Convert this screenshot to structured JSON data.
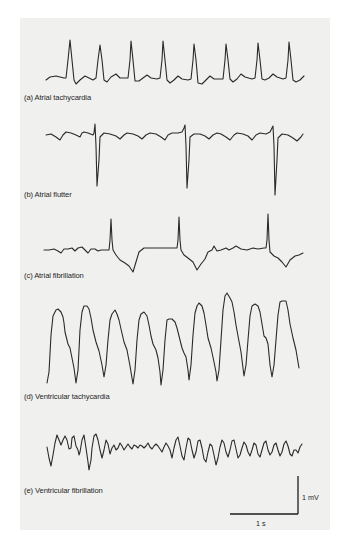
{
  "figure": {
    "panels": [
      {
        "id": "a",
        "label": "(a) Atrial tachycardia"
      },
      {
        "id": "b",
        "label": "(b) Atrial flutter"
      },
      {
        "id": "c",
        "label": "(c) Atrial fibrillation"
      },
      {
        "id": "d",
        "label": "(d) Ventricular tachycardia"
      },
      {
        "id": "e",
        "label": "(e) Ventricular fibrillation"
      }
    ],
    "scale_bar": {
      "voltage_label": "1 mV",
      "time_label": "1 s"
    },
    "colors": {
      "background": "#ffffff",
      "panel": "#f0f0ef",
      "trace": "#2a2a2a"
    }
  }
}
